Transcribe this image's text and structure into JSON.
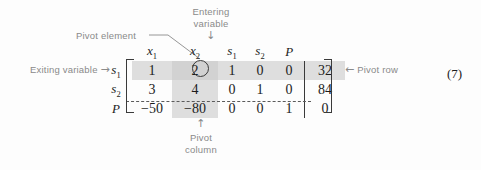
{
  "figure": {
    "equation_number": "(7)",
    "annotations": {
      "pivot_element": "Pivot element",
      "entering_variable_line1": "Entering",
      "entering_variable_line2": "variable",
      "entering_arrow": "↓",
      "exiting_variable": "Exiting variable",
      "exiting_arrow": "→",
      "pivot_row": "Pivot row",
      "pivot_row_arrow": "←",
      "pivot_column_arrow": "↑",
      "pivot_column_line1": "Pivot",
      "pivot_column_line2": "column"
    },
    "matrix": {
      "column_headers": [
        "x",
        "x",
        "s",
        "s",
        "P"
      ],
      "column_header_subs": [
        "1",
        "2",
        "1",
        "2",
        ""
      ],
      "row_labels": [
        "s",
        "s",
        "P"
      ],
      "row_label_subs": [
        "1",
        "2",
        ""
      ],
      "rows": [
        {
          "cells": [
            "1",
            "2",
            "1",
            "0",
            "0"
          ],
          "rhs": "32"
        },
        {
          "cells": [
            "3",
            "4",
            "0",
            "1",
            "0"
          ],
          "rhs": "84"
        },
        {
          "cells": [
            "−50",
            "−80",
            "0",
            "0",
            "1"
          ],
          "rhs": "0"
        }
      ],
      "pivot_element_value": "2",
      "pivot_row_index": 0,
      "pivot_column_index": 1
    },
    "colors": {
      "shade": "#dedede",
      "shade_overlap": "#d2d2d2",
      "annotation_text": "#8a8a8a",
      "matrix_text": "#1c1c1c",
      "rule": "#3a3a3a",
      "background": "#fdfdfd"
    }
  }
}
